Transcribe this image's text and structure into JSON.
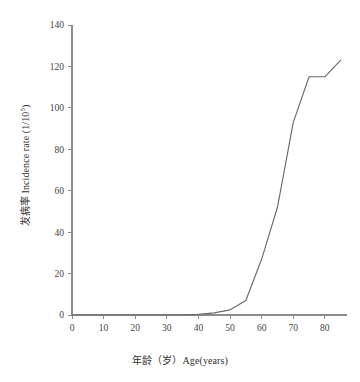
{
  "chart_data": {
    "type": "line",
    "title": "",
    "xlabel": "年龄（岁）Age(years)",
    "ylabel_cn": "发病率",
    "ylabel_en": "Incidence rate (1/10",
    "ylabel_exp": "5",
    "ylabel_tail": ")",
    "ylabel_full": "发病率 Incidence rate (1/10⁵)",
    "xlim": [
      0,
      87
    ],
    "ylim": [
      0,
      140
    ],
    "xticks": [
      0,
      10,
      20,
      30,
      40,
      50,
      60,
      70,
      80
    ],
    "yticks": [
      0,
      20,
      40,
      60,
      80,
      100,
      120,
      140
    ],
    "xtick_labels": [
      "0",
      "10",
      "20",
      "30",
      "40",
      "50",
      "60",
      "70",
      "80"
    ],
    "ytick_labels": [
      "0",
      "20",
      "40",
      "60",
      "80",
      "100",
      "120",
      "140"
    ],
    "grid": false,
    "legend": false,
    "line_color": "#6b6b6b",
    "axis_color": "#8c8c8c",
    "x": [
      0,
      5,
      10,
      15,
      20,
      25,
      30,
      35,
      40,
      45,
      50,
      55,
      60,
      65,
      70,
      75,
      80,
      85
    ],
    "values": [
      0,
      0,
      0,
      0,
      0,
      0,
      0,
      0,
      0.3,
      1.0,
      2.5,
      7.0,
      27,
      52,
      93,
      115,
      115,
      123
    ],
    "series": [
      {
        "name": "Incidence rate",
        "values": [
          0,
          0,
          0,
          0,
          0,
          0,
          0,
          0,
          0.3,
          1.0,
          2.5,
          7.0,
          27,
          52,
          93,
          115,
          115,
          123
        ]
      }
    ]
  }
}
